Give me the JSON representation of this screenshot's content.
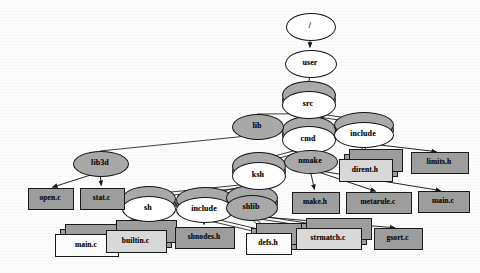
{
  "diagram": {
    "type": "node-link-tree",
    "colors": {
      "edge": "#1a1a1a",
      "dir_fill_white": "#ffffff",
      "dir_fill_grey": "#a8a8a8",
      "file_fill_grey": "#9d9d9d",
      "file_fill_light": "#d8d8d8",
      "file_fill_white": "#fbfbfb",
      "background": "#fdfdfd"
    },
    "nodes": [
      {
        "id": "root",
        "label": "/",
        "shape": "ellipse",
        "fill": "white",
        "x": 310,
        "y": 26,
        "rx": 24,
        "ry": 13,
        "stacked": false,
        "font": 8
      },
      {
        "id": "user",
        "label": "user",
        "shape": "ellipse",
        "fill": "white",
        "x": 310,
        "y": 63,
        "rx": 25,
        "ry": 13,
        "stacked": false,
        "font": 8
      },
      {
        "id": "src",
        "label": "src",
        "shape": "ellipse",
        "fill": "white",
        "x": 308,
        "y": 104,
        "rx": 26,
        "ry": 13,
        "stacked": true,
        "font": 8
      },
      {
        "id": "lib",
        "label": "lib",
        "shape": "ellipse",
        "fill": "grey",
        "x": 257,
        "y": 126,
        "rx": 25,
        "ry": 12,
        "stacked": false,
        "font": 8
      },
      {
        "id": "cmd",
        "label": "cmd",
        "shape": "ellipse",
        "fill": "white",
        "x": 308,
        "y": 139,
        "rx": 26,
        "ry": 13,
        "stacked": true,
        "font": 8
      },
      {
        "id": "include1",
        "label": "include",
        "shape": "ellipse",
        "fill": "white",
        "x": 363,
        "y": 134,
        "rx": 29,
        "ry": 12,
        "stacked": true,
        "font": 8
      },
      {
        "id": "lib3d",
        "label": "lib3d",
        "shape": "ellipse",
        "fill": "grey",
        "x": 100,
        "y": 163,
        "rx": 27,
        "ry": 12,
        "stacked": false,
        "font": 8
      },
      {
        "id": "ksh",
        "label": "ksh",
        "shape": "ellipse",
        "fill": "white",
        "x": 258,
        "y": 175,
        "rx": 26,
        "ry": 13,
        "stacked": true,
        "font": 8
      },
      {
        "id": "nmake",
        "label": "nmake",
        "shape": "ellipse",
        "fill": "grey",
        "x": 310,
        "y": 161,
        "rx": 26,
        "ry": 11,
        "stacked": false,
        "font": 8
      },
      {
        "id": "sh",
        "label": "sh",
        "shape": "ellipse",
        "fill": "white",
        "x": 148,
        "y": 208,
        "rx": 26,
        "ry": 12,
        "stacked": true,
        "font": 8
      },
      {
        "id": "include2",
        "label": "include",
        "shape": "ellipse",
        "fill": "white",
        "x": 204,
        "y": 209,
        "rx": 28,
        "ry": 12,
        "stacked": true,
        "font": 8
      },
      {
        "id": "shlib",
        "label": "shlib",
        "shape": "ellipse",
        "fill": "grey",
        "x": 251,
        "y": 207,
        "rx": 25,
        "ry": 12,
        "stacked": true,
        "font": 8
      },
      {
        "id": "open_c",
        "label": "open.c",
        "shape": "rect",
        "fill": "grey",
        "x": 28,
        "y": 188,
        "w": 44,
        "h": 20,
        "stacked": false,
        "font": 7.5
      },
      {
        "id": "stat_c",
        "label": "stat.c",
        "shape": "rect",
        "fill": "grey",
        "x": 80,
        "y": 188,
        "w": 43,
        "h": 20,
        "stacked": false,
        "font": 7.5
      },
      {
        "id": "dirent_h",
        "label": "dirent.h",
        "shape": "rect",
        "fill": "light",
        "x": 339,
        "y": 159,
        "w": 52,
        "h": 21,
        "stacked": true,
        "font": 7.5
      },
      {
        "id": "limits_h",
        "label": "limits.h",
        "shape": "rect",
        "fill": "grey",
        "x": 411,
        "y": 152,
        "w": 56,
        "h": 20,
        "stacked": false,
        "font": 7.5
      },
      {
        "id": "make_h",
        "label": "make.h",
        "shape": "rect",
        "fill": "grey",
        "x": 292,
        "y": 192,
        "w": 46,
        "h": 20,
        "stacked": false,
        "font": 7.5
      },
      {
        "id": "metarule_c",
        "label": "metarule.c",
        "shape": "rect",
        "fill": "grey",
        "x": 346,
        "y": 192,
        "w": 64,
        "h": 20,
        "stacked": false,
        "font": 7.5
      },
      {
        "id": "main_c_r",
        "label": "main.c",
        "shape": "rect",
        "fill": "grey",
        "x": 418,
        "y": 191,
        "w": 50,
        "h": 20,
        "stacked": false,
        "font": 7.5
      },
      {
        "id": "main_c_l",
        "label": "main.c",
        "shape": "rect",
        "fill": "white",
        "x": 55,
        "y": 234,
        "w": 62,
        "h": 21,
        "stacked": true,
        "font": 7.5
      },
      {
        "id": "builtin_c",
        "label": "builtin.c",
        "shape": "rect",
        "fill": "light",
        "x": 106,
        "y": 230,
        "w": 59,
        "h": 21,
        "stacked": true,
        "font": 7.5
      },
      {
        "id": "shnodes_h",
        "label": "shnodes.h",
        "shape": "rect",
        "fill": "grey",
        "x": 175,
        "y": 227,
        "w": 58,
        "h": 20,
        "stacked": false,
        "font": 7.5
      },
      {
        "id": "defs_h",
        "label": "defs.h",
        "shape": "rect",
        "fill": "white",
        "x": 246,
        "y": 233,
        "w": 44,
        "h": 20,
        "stacked": true,
        "font": 7.5
      },
      {
        "id": "strmatch_c",
        "label": "strmatch.c",
        "shape": "rect",
        "fill": "light",
        "x": 296,
        "y": 228,
        "w": 64,
        "h": 20,
        "stacked": true,
        "font": 7.5
      },
      {
        "id": "gsort_c",
        "label": "gsort.c",
        "shape": "rect",
        "fill": "grey",
        "x": 374,
        "y": 228,
        "w": 47,
        "h": 20,
        "stacked": false,
        "font": 7.5
      }
    ],
    "edges": [
      {
        "from": "root",
        "to": "user",
        "style": "single"
      },
      {
        "from": "user",
        "to": "src",
        "style": "single"
      },
      {
        "from": "src",
        "to": "lib",
        "style": "plain"
      },
      {
        "from": "src",
        "to": "cmd",
        "style": "double"
      },
      {
        "from": "src",
        "to": "include1",
        "style": "double"
      },
      {
        "from": "lib",
        "to": "lib3d",
        "style": "plain"
      },
      {
        "from": "lib3d",
        "to": "open_c",
        "style": "single"
      },
      {
        "from": "lib3d",
        "to": "stat_c",
        "style": "single"
      },
      {
        "from": "cmd",
        "to": "ksh",
        "style": "double"
      },
      {
        "from": "cmd",
        "to": "nmake",
        "style": "single"
      },
      {
        "from": "include1",
        "to": "dirent_h",
        "style": "double"
      },
      {
        "from": "include1",
        "to": "limits_h",
        "style": "single"
      },
      {
        "from": "nmake",
        "to": "make_h",
        "style": "single"
      },
      {
        "from": "nmake",
        "to": "metarule_c",
        "style": "single"
      },
      {
        "from": "nmake",
        "to": "main_c_r",
        "style": "single"
      },
      {
        "from": "ksh",
        "to": "sh",
        "style": "double"
      },
      {
        "from": "ksh",
        "to": "include2",
        "style": "double"
      },
      {
        "from": "ksh",
        "to": "shlib",
        "style": "double"
      },
      {
        "from": "sh",
        "to": "main_c_l",
        "style": "double"
      },
      {
        "from": "sh",
        "to": "builtin_c",
        "style": "single"
      },
      {
        "from": "include2",
        "to": "shnodes_h",
        "style": "single"
      },
      {
        "from": "include2",
        "to": "defs_h",
        "style": "double"
      },
      {
        "from": "shlib",
        "to": "defs_h",
        "style": "double"
      },
      {
        "from": "shlib",
        "to": "strmatch_c",
        "style": "double"
      },
      {
        "from": "shlib",
        "to": "gsort_c",
        "style": "single"
      }
    ]
  }
}
